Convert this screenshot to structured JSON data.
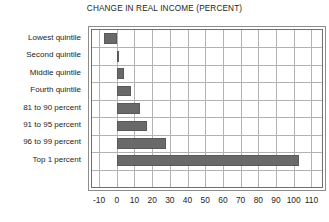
{
  "chart_data": {
    "type": "bar",
    "orientation": "horizontal",
    "title": "CHANGE IN REAL INCOME (PERCENT)",
    "xlabel": "",
    "ylabel": "",
    "categories": [
      "Lowest quintile",
      "Second quintile",
      "Middle quintile",
      "Fourth quintile",
      "81 to 90 percent",
      "91 to 95 percent",
      "96 to 99 percent",
      "Top 1 percent"
    ],
    "values": [
      -7,
      1,
      4,
      8,
      13,
      17,
      28,
      103
    ],
    "xlim": [
      -14,
      116
    ],
    "xticks": [
      -10,
      0,
      10,
      20,
      30,
      40,
      50,
      60,
      70,
      80,
      90,
      100,
      110
    ],
    "xtick_labels": [
      "-10",
      "0",
      "10",
      "20",
      "30",
      "40",
      "50",
      "60",
      "70",
      "80",
      "90",
      "100",
      "110"
    ],
    "grid": true,
    "grid_axis": "both",
    "legend": false,
    "bar_color": "#696969",
    "grid_color": "#b2b2b2",
    "frame_color": "#6f6f6f",
    "background": "#ffffff"
  }
}
